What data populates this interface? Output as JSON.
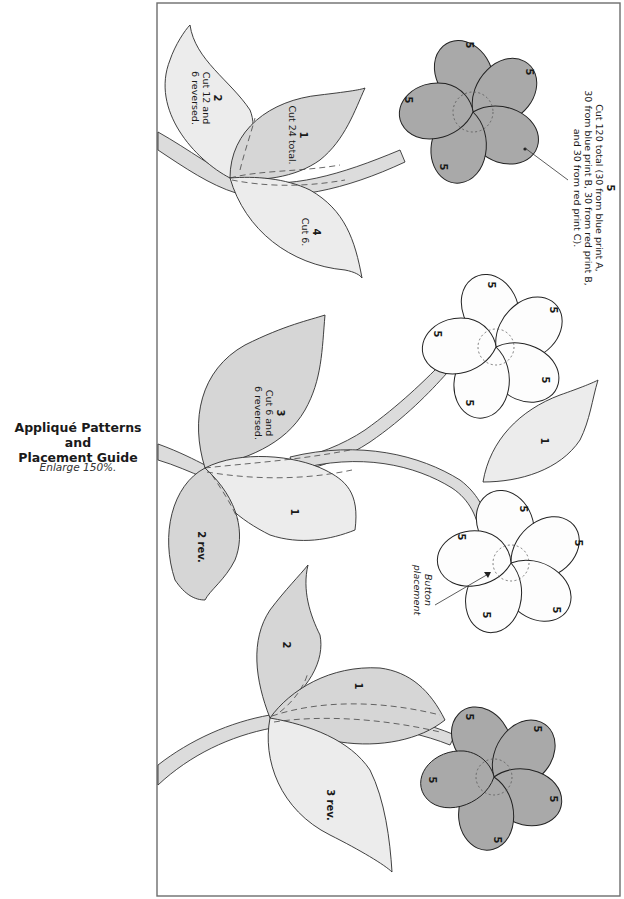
{
  "sidebar": {
    "title_line1": "Appliqué Patterns and",
    "title_line2": "Placement Guide",
    "note": "Enlarge 150%."
  },
  "colors": {
    "frame_border": "#6d6d6d",
    "dark_petal_fill": "#a9a9a9",
    "light_petal_fill": "#fdfdfd",
    "leaf_light_fill": "#ececec",
    "leaf_mid_fill": "#d6d6d6",
    "stem_fill": "#dcdcdc",
    "outline": "#222222"
  },
  "labels": {
    "piece1_top": {
      "num": "1",
      "text": "Cut 24 total."
    },
    "piece2_top": {
      "num": "2",
      "line1": "Cut 12 and",
      "line2": "6 reversed."
    },
    "piece4_top": {
      "num": "4",
      "text": "Cut 6."
    },
    "piece3_mid": {
      "num": "3",
      "line1": "Cut 6 and",
      "line2": "6 reversed."
    },
    "piece1_mid": "1",
    "piece2rev_mid": "2 rev.",
    "piece1_right": "1",
    "piece2_bottom": "2",
    "piece1_bottom": "1",
    "piece3rev_bottom": "3 rev.",
    "petal": "5",
    "piece5_callout": {
      "num": "5",
      "line1": "Cut 120 total (30 from blue print A,",
      "line2": "30 from blue print B, 30 from red print B,",
      "line3": "and 30 from red print C)."
    },
    "button_callout": {
      "line1": "Button",
      "line2": "placement"
    }
  }
}
